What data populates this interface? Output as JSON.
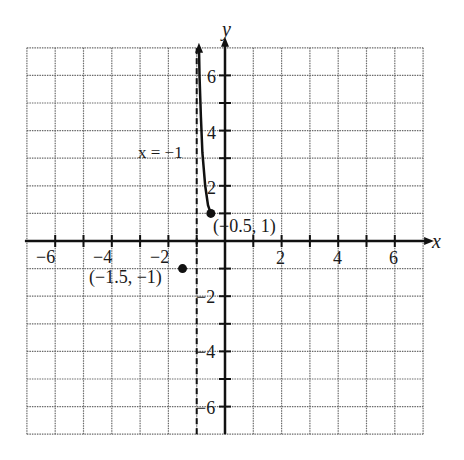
{
  "chart_data": {
    "type": "line",
    "title": "",
    "xlabel": "x",
    "ylabel": "y",
    "xlim": [
      -7,
      7
    ],
    "ylim": [
      -7,
      7
    ],
    "grid": true,
    "x_ticks": [
      -6,
      -4,
      -2,
      2,
      4,
      6
    ],
    "y_ticks": [
      -6,
      -4,
      -2,
      2,
      4,
      6
    ],
    "x_tick_labels": [
      "−6",
      "−4",
      "−2",
      "2",
      "4",
      "6"
    ],
    "y_tick_labels": [
      "6",
      "4",
      "2",
      "−2",
      "−4",
      "−6"
    ],
    "asymptote": {
      "x": -1,
      "label": "x = −1",
      "style": "dashed"
    },
    "series": [
      {
        "name": "curve",
        "points": [
          [
            -0.5,
            1
          ],
          [
            -0.6,
            1.3
          ],
          [
            -0.7,
            2
          ],
          [
            -0.8,
            3.2
          ],
          [
            -0.85,
            4.5
          ],
          [
            -0.9,
            6
          ],
          [
            -0.92,
            7
          ]
        ],
        "endpoint": [
          -0.5,
          1
        ],
        "arrow_end": "up"
      }
    ],
    "annotations": [
      {
        "text": "(−0.5, 1)",
        "point": [
          -0.5,
          1
        ]
      },
      {
        "text": "(−1.5, −1)",
        "point": [
          -1.5,
          -1
        ]
      }
    ],
    "legend": null
  },
  "labels": {
    "x_axis": "x",
    "y_axis": "y",
    "asymptote": "x = −1",
    "point_a": "(−0.5, 1)",
    "point_b": "(−1.5, −1)",
    "xt": [
      "−6",
      "−4",
      "−2",
      "2",
      "4",
      "6"
    ],
    "yt": [
      "6",
      "4",
      "2",
      "−2",
      "−4",
      "−6"
    ]
  }
}
